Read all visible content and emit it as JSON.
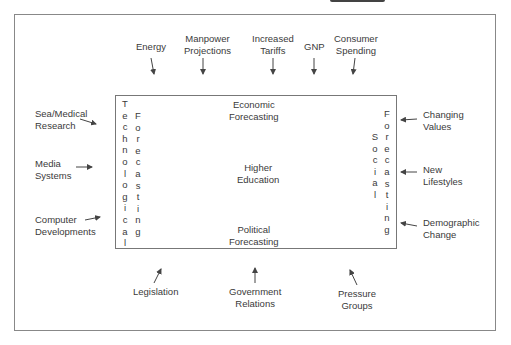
{
  "diagram": {
    "center": {
      "top": "Economic\nForecasting",
      "middle": "Higher\nEducation",
      "bottom": "Political\nForecasting",
      "left_col1": "Technological",
      "left_col2": "Forecasting",
      "right_col1": "Social",
      "right_col2": "Forecasting"
    },
    "top_inputs": [
      {
        "label": "Energy"
      },
      {
        "label": "Manpower\nProjections"
      },
      {
        "label": "Increased\nTariffs"
      },
      {
        "label": "GNP"
      },
      {
        "label": "Consumer\nSpending"
      }
    ],
    "left_inputs": [
      {
        "label": "Sea/Medical\nResearch"
      },
      {
        "label": "Media\nSystems"
      },
      {
        "label": "Computer\nDevelopments"
      }
    ],
    "right_inputs": [
      {
        "label": "Changing\nValues"
      },
      {
        "label": "New\nLifestyles"
      },
      {
        "label": "Demographic\nChange"
      }
    ],
    "bottom_inputs": [
      {
        "label": "Legislation"
      },
      {
        "label": "Government\nRelations"
      },
      {
        "label": "Pressure\nGroups"
      }
    ],
    "colors": {
      "line": "#777777",
      "text": "#3a3a3a",
      "background": "#ffffff"
    }
  }
}
